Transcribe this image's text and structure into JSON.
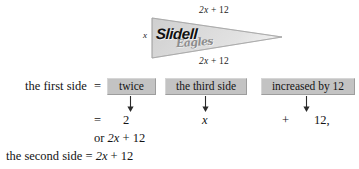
{
  "figure": {
    "name": "pennant-flag",
    "wordmark": "Slidell",
    "script_word": "Eagles",
    "labels": {
      "top_side": "2x + 12",
      "bottom_side": "2x + 12",
      "left_side": "x"
    },
    "colors": {
      "pennant_fill_light": "#d9d9d9",
      "pennant_fill_dark": "#bcbcbc",
      "pennant_outline": "#8a8a8a"
    }
  },
  "translation": {
    "row_label": "the first side",
    "equals": "=",
    "phrases": [
      {
        "label": "twice"
      },
      {
        "label": "the third side"
      },
      {
        "label": "increased by 12"
      }
    ],
    "values": {
      "equals": "=",
      "first": "2",
      "second": "x",
      "operator": "+",
      "third": "12,"
    },
    "or_line": "or 2x + 12",
    "second_side_line": "the second side = 2x + 12"
  },
  "colors": {
    "box_fill": "#c3c3c3",
    "text": "#141414",
    "page_background": "#ffffff"
  }
}
